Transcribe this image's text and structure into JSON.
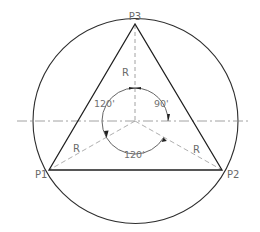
{
  "diagram": {
    "points": {
      "p1": "P1",
      "p2": "P2",
      "p3": "P3"
    },
    "radius_labels": {
      "top": "R",
      "left": "R",
      "right": "R"
    },
    "angle_labels": {
      "upper_left": "120'",
      "upper_right": "90'",
      "bottom": "120'"
    },
    "colors": {
      "stroke": "#2a2a2a",
      "construction": "#8a8a8a",
      "text": "#6a6a6a"
    }
  }
}
